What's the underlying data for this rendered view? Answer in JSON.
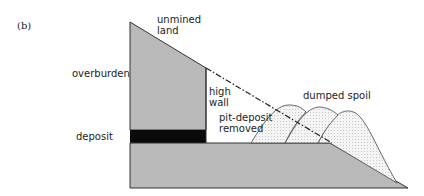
{
  "panel_label": "(b)",
  "labels": {
    "unmined_land_1": "unmined",
    "unmined_land_2": "land",
    "overburden": "overburden",
    "high_wall_1": "high",
    "high_wall_2": "wall",
    "dumped_spoil": "dumped spoil",
    "pit_deposit_1": "pit-deposit",
    "pit_deposit_2": "removed",
    "deposit": "deposit"
  },
  "colors": {
    "ground": "#b9b9b9",
    "deposit": "#0a0a0a",
    "spoil": "#efefef",
    "line": "#333333"
  }
}
